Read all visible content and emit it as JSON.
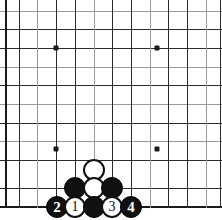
{
  "diagram": {
    "type": "go-board-diagram",
    "board": {
      "line_color": "#2b2b2b",
      "faint_line_color": "#9a9a9a",
      "edge_color": "#1a1a1a",
      "background_color": "#ffffff",
      "left_edge_visible": true,
      "bottom_edge_visible": true,
      "top_cropped": true,
      "right_cropped": true,
      "column_positions": [
        5,
        19,
        37,
        56,
        75,
        94,
        112,
        131,
        150,
        168,
        187,
        206,
        220
      ],
      "row_positions": [
        11,
        29,
        48,
        67,
        85,
        104,
        123,
        141,
        160,
        179,
        188,
        207
      ]
    },
    "hoshi_label": "star-point",
    "star_points": [
      {
        "x": 56,
        "y": 48
      },
      {
        "x": 157,
        "y": 48
      },
      {
        "x": 56,
        "y": 149
      },
      {
        "x": 157,
        "y": 149
      }
    ],
    "stones": [
      {
        "id": "stone-white-top",
        "color": "white",
        "label": "",
        "x": 94,
        "y": 170
      },
      {
        "id": "stone-black-left",
        "color": "black",
        "label": "",
        "x": 75,
        "y": 188
      },
      {
        "id": "stone-white-center",
        "color": "white",
        "label": "",
        "x": 94,
        "y": 188
      },
      {
        "id": "stone-black-right",
        "color": "black",
        "label": "",
        "x": 112,
        "y": 188
      },
      {
        "id": "stone-move-2",
        "color": "black",
        "label": "2",
        "x": 57,
        "y": 207
      },
      {
        "id": "stone-move-1",
        "color": "white",
        "label": "1",
        "x": 75,
        "y": 207
      },
      {
        "id": "stone-black-bottom",
        "color": "black",
        "label": "",
        "x": 94,
        "y": 207
      },
      {
        "id": "stone-move-3",
        "color": "white",
        "label": "3",
        "x": 112,
        "y": 207
      },
      {
        "id": "stone-move-4",
        "color": "black",
        "label": "4",
        "x": 131,
        "y": 207
      }
    ]
  }
}
